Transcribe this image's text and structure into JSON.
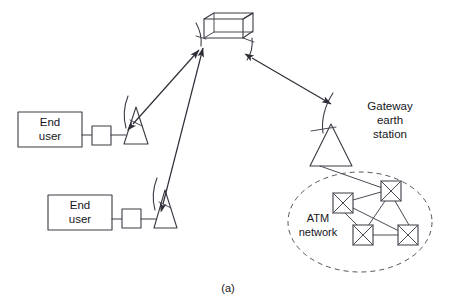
{
  "figure": {
    "caption": "(a)",
    "labels": {
      "end_user_top": [
        "End",
        "user"
      ],
      "end_user_bottom": [
        "End",
        "user"
      ],
      "gateway": [
        "Gateway",
        "earth",
        "station"
      ],
      "atm_network": [
        "ATM",
        "network"
      ]
    },
    "colors": {
      "stroke": "#3a3a44",
      "text": "#16161c",
      "background": "#ffffff",
      "dashed_stroke": "#55555f"
    },
    "nodes": {
      "satellite": {
        "name": "satellite",
        "x": 224,
        "y": 27
      },
      "terminal_top": {
        "name": "vsat-terminal-top",
        "x": 134,
        "y": 130
      },
      "terminal_bottom": {
        "name": "vsat-terminal-bottom",
        "x": 163,
        "y": 213
      },
      "gateway_station": {
        "name": "gateway-earth-station",
        "x": 330,
        "y": 140
      },
      "atm_switches": [
        {
          "name": "atm-switch-1",
          "x": 343,
          "y": 203
        },
        {
          "name": "atm-switch-2",
          "x": 391,
          "y": 191
        },
        {
          "name": "atm-switch-3",
          "x": 363,
          "y": 235
        },
        {
          "name": "atm-switch-4",
          "x": 408,
          "y": 235
        }
      ]
    },
    "links": [
      {
        "name": "link-terminal-top-satellite",
        "type": "bidirectional"
      },
      {
        "name": "link-terminal-bottom-satellite",
        "type": "bidirectional"
      },
      {
        "name": "link-satellite-gateway",
        "type": "bidirectional"
      },
      {
        "name": "link-gateway-atm",
        "type": "line"
      }
    ]
  }
}
